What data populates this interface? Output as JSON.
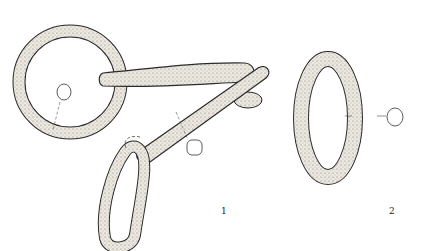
{
  "figure": {
    "items": [
      {
        "id": "1",
        "label": "1",
        "description": "iron ring with bar link and loop"
      },
      {
        "id": "2",
        "label": "2",
        "description": "oval iron ring"
      }
    ],
    "colors": {
      "stroke": "#2a2a2a",
      "fill": "#e6e2da",
      "stipple": "#555555"
    }
  }
}
